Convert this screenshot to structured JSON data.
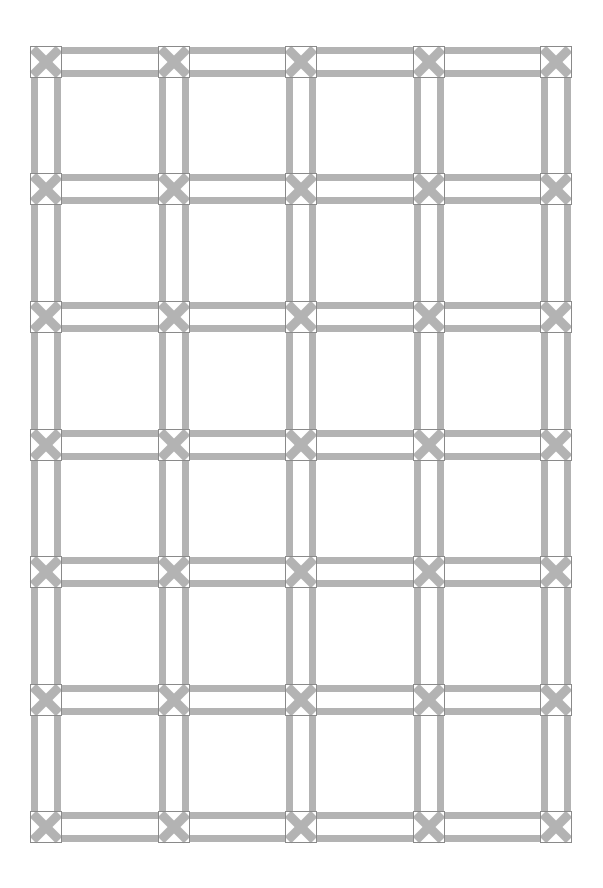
{
  "pattern": {
    "title": "Lattice grid pattern",
    "columns_x": [
      30,
      158,
      285,
      413,
      540
    ],
    "rows_y": [
      46,
      173,
      301,
      429,
      556,
      684,
      811
    ],
    "node_size": 32,
    "bar_width": 7,
    "colors": {
      "background": "#ffffff",
      "bar": "#b3b3b3",
      "node_outline": "#8a8a8a",
      "cross": "#b3b3b3"
    },
    "node_glyph": "x-cross-icon"
  }
}
